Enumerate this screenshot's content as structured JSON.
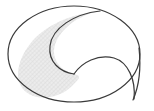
{
  "figure": {
    "type": "geometric-diagram",
    "canvas": {
      "width": 154,
      "height": 111
    },
    "background_color": "#ffffff",
    "stroke_color": "#3a3a3a",
    "stroke_width": 1.1,
    "fill_color": "#e8e8e8",
    "hatch_color": "#cfcfcf",
    "hatch_spacing": 3,
    "shapes": [
      {
        "name": "outer-circle",
        "role": "boundary",
        "center_x": 74,
        "center_y": 54,
        "radius_x": 66,
        "radius_y": 48,
        "filled": false
      },
      {
        "name": "hatched-region",
        "role": "shaded-lune",
        "filled": true,
        "fill": "#e8e8e8",
        "hatched": true
      },
      {
        "name": "upper-inner-arc",
        "role": "divider",
        "filled": false
      },
      {
        "name": "lower-inner-arc",
        "role": "divider",
        "filled": false
      }
    ],
    "key_points": {
      "top_cusp_x": 96,
      "top_cusp_y": 12,
      "center_cusp_x": 74,
      "center_cusp_y": 74,
      "bottom_right_cusp_x": 134,
      "bottom_right_cusp_y": 99,
      "left_extreme_x": 8,
      "left_extreme_y": 54
    },
    "caption": ""
  }
}
